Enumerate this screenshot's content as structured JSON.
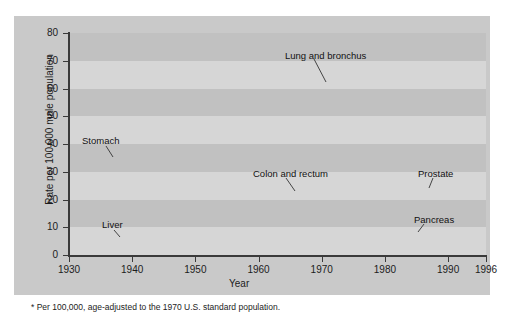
{
  "figure": {
    "footnote": "* Per 100,000, age-adjusted to the 1970 U.S. standard population.",
    "card_bg": "#c9c9c9",
    "plot_bg": "#cfcfcf",
    "band_color": "#c0c0c0",
    "line_color": "#2b2b2b",
    "highlight_color": "#f2f2f2"
  },
  "chart_data": {
    "type": "line",
    "title": "",
    "subtitle": "",
    "xlabel": "Year",
    "ylabel": "Rate per 100,000 male population",
    "xlim": [
      1930,
      1996
    ],
    "ylim": [
      0,
      80
    ],
    "grid": "horizontal-bands",
    "legend_position": "inline-annotations",
    "xticks": [
      1930,
      1940,
      1950,
      1960,
      1970,
      1980,
      1990,
      1996
    ],
    "xticklabels": [
      "1930",
      "1940",
      "1950",
      "1960",
      "1970",
      "1980",
      "1990",
      "1996"
    ],
    "yticks": [
      0,
      10,
      20,
      30,
      40,
      50,
      60,
      70,
      80
    ],
    "yticklabels": [
      "0",
      "10",
      "20",
      "30",
      "40",
      "50",
      "60",
      "70",
      "80"
    ],
    "x": [
      1930,
      1935,
      1940,
      1945,
      1950,
      1955,
      1960,
      1965,
      1970,
      1975,
      1980,
      1985,
      1990,
      1992,
      1994,
      1996
    ],
    "series": [
      {
        "name": "Lung and bronchus",
        "label": "Lung and bronchus",
        "label_x": 271,
        "label_y": 35,
        "leader": {
          "x1": 300,
          "y1": 43,
          "x2": 312,
          "y2": 66
        },
        "values": [
          5,
          6,
          8,
          11,
          15,
          22,
          31,
          40,
          50,
          60,
          67,
          72,
          75,
          76,
          74,
          71
        ]
      },
      {
        "name": "Stomach",
        "label": "Stomach",
        "label_x": 68,
        "label_y": 120,
        "leader": {
          "x1": 92,
          "y1": 130,
          "x2": 99,
          "y2": 141
        },
        "values": [
          38,
          37,
          35,
          32,
          28,
          24,
          21,
          17,
          14,
          12,
          10,
          8,
          7,
          6,
          6,
          5
        ]
      },
      {
        "name": "Colon and rectum",
        "label": "Colon and rectum",
        "label_x": 239,
        "label_y": 153,
        "leader": {
          "x1": 272,
          "y1": 162,
          "x2": 281,
          "y2": 175
        },
        "values": [
          20,
          22,
          23,
          24,
          25,
          25,
          25,
          25,
          25,
          25,
          25,
          24,
          24,
          23,
          22,
          22
        ]
      },
      {
        "name": "Prostate",
        "label": "Prostate",
        "label_x": 404,
        "label_y": 153,
        "leader": {
          "x1": 419,
          "y1": 162,
          "x2": 415,
          "y2": 172
        },
        "values": [
          15,
          16,
          17,
          18,
          19,
          20,
          21,
          21,
          22,
          22,
          23,
          24,
          25,
          28,
          27,
          26
        ]
      },
      {
        "name": "Liver",
        "label": "Liver",
        "label_x": 88,
        "label_y": 204,
        "leader": {
          "x1": 100,
          "y1": 214,
          "x2": 106,
          "y2": 221
        },
        "values": [
          10,
          10,
          9,
          9,
          9,
          8,
          7,
          7,
          7,
          6,
          6,
          6,
          6,
          6,
          6,
          6
        ]
      },
      {
        "name": "Pancreas",
        "label": "Pancreas",
        "label_x": 400,
        "label_y": 199,
        "leader": {
          "x1": 410,
          "y1": 208,
          "x2": 404,
          "y2": 216
        },
        "values": [
          6,
          6,
          7,
          8,
          9,
          10,
          10,
          11,
          11,
          11,
          11,
          11,
          11,
          10,
          10,
          10
        ]
      }
    ]
  }
}
